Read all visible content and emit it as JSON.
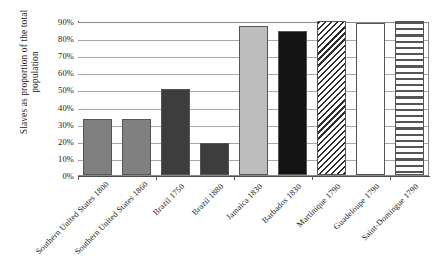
{
  "chart_data": {
    "type": "bar",
    "title": "",
    "xlabel": "",
    "ylabel": "Slaves as proportion of the total population",
    "ylim": [
      0,
      90
    ],
    "grid": true,
    "legend": "none",
    "categories": [
      "Southern United States 1800",
      "Southern United States 1860",
      "Brazil 1750",
      "Brazil 1880",
      "Jamaica 1830",
      "Barbados 1830",
      "Martinique 1790",
      "Guadeloupe 1790",
      "Saint-Domingue 1790"
    ],
    "values": [
      33,
      33,
      50,
      19,
      87,
      84,
      90,
      89,
      91
    ],
    "value_labels": [
      "33%",
      "33%",
      "50%",
      "19%",
      "87%",
      "84%",
      "90%",
      "89%",
      "91%"
    ],
    "bar_fills": [
      "medium-gray",
      "medium-gray",
      "dark-gray",
      "dark-gray",
      "light-gray",
      "black",
      "diagonal-hatch",
      "white",
      "horizontal-stripes"
    ],
    "ytick_labels": [
      "90%",
      "80%",
      "70%",
      "60%",
      "50%",
      "40%",
      "30%",
      "20%",
      "10%",
      "0%"
    ],
    "ytick_values": [
      90,
      80,
      70,
      60,
      50,
      40,
      30,
      20,
      10,
      0
    ],
    "colors": {
      "medium_gray": "#808080",
      "dark_gray": "#3d3d3d",
      "light_gray": "#bdbdbd",
      "black": "#141414",
      "white": "#ffffff",
      "hatch_stroke": "#2e2e2e",
      "gridline": "#a8a8a8",
      "axis": "#4a4a4a",
      "text": "#1a1a1a",
      "background": "#ffffff"
    }
  }
}
